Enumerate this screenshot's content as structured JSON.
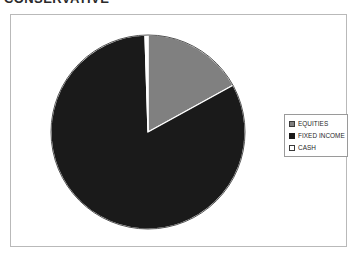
{
  "title": "CONSERVATIVE",
  "legend": {
    "position": "right",
    "items": [
      {
        "label": "EQUITIES",
        "swatch_name": "legend-swatch-equities",
        "fill": "#808080",
        "border": "#3a3a3a"
      },
      {
        "label": "FIXED INCOME",
        "swatch_name": "legend-swatch-fixed-income",
        "fill": "#1a1a1a",
        "border": "#1a1a1a"
      },
      {
        "label": "CASH",
        "swatch_name": "legend-swatch-cash",
        "fill": "#ffffff",
        "border": "#3a3a3a"
      }
    ]
  },
  "chart_data": {
    "type": "pie",
    "title": "CONSERVATIVE",
    "xlabel": "",
    "ylabel": "",
    "categories": [
      "EQUITIES",
      "FIXED INCOME",
      "CASH"
    ],
    "values": [
      17.0,
      82.5,
      0.5
    ],
    "units": "percent",
    "colors": [
      "#808080",
      "#1a1a1a",
      "#ffffff"
    ],
    "slice_borders": [
      "#ffffff",
      "#ffffff",
      "#ffffff"
    ],
    "start_angle_deg": 0,
    "direction": "clockwise",
    "slice_angles_deg": [
      61.2,
      297.0,
      1.8
    ],
    "legend_position": "right",
    "grid": false,
    "labels_shown": false,
    "geometry": {
      "center_x": 148,
      "center_y": 132,
      "radius": 97
    }
  },
  "frame": {
    "border_color": "#b9b9b9",
    "background": "#ffffff"
  }
}
